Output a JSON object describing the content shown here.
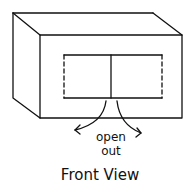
{
  "diagram": {
    "labels": {
      "action": "open",
      "action_line2": "out",
      "caption": "Front View"
    },
    "annotations": [
      "left door opens outward",
      "right door opens outward"
    ]
  }
}
